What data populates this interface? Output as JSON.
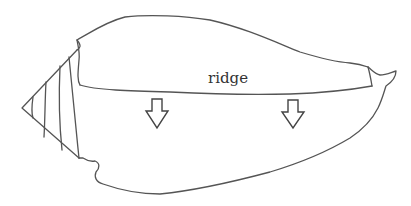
{
  "figure": {
    "labels": {
      "ridge": "ridge"
    },
    "annotations": [
      {
        "type": "arrow",
        "direction": "down",
        "label": "arrow-left"
      },
      {
        "type": "arrow",
        "direction": "down",
        "label": "arrow-right"
      }
    ],
    "colors": {
      "line": "#555555",
      "background": "#ffffff",
      "text": "#333333"
    }
  }
}
